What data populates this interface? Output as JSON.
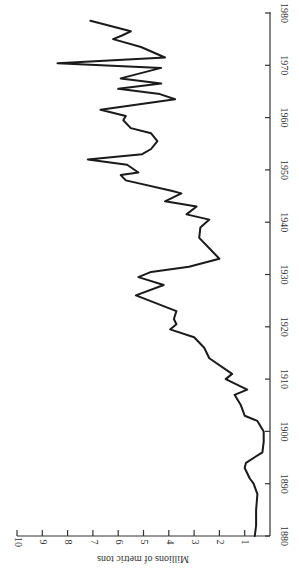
{
  "chart_data": {
    "type": "line",
    "title": "",
    "orientation": "rotated-90 (years run bottom-to-top along right edge; values increase leftward)",
    "xlabel": "",
    "ylabel": "Millions of metric tons",
    "xlim": [
      1880,
      1980
    ],
    "ylim": [
      0,
      10
    ],
    "x_ticks": [
      1880,
      1890,
      1900,
      1910,
      1920,
      1930,
      1940,
      1950,
      1960,
      1970,
      1980
    ],
    "y_ticks": [
      1,
      2,
      3,
      4,
      5,
      6,
      7,
      8,
      9,
      10
    ],
    "grid": false,
    "legend": null,
    "series": [
      {
        "name": "Production",
        "x": [
          1880,
          1882,
          1885,
          1888,
          1890,
          1891,
          1893,
          1894,
          1896,
          1898,
          1900,
          1902,
          1903,
          1905,
          1907,
          1908,
          1910,
          1911,
          1914,
          1916,
          1918,
          1919.5,
          1920.5,
          1921.5,
          1923,
          1926,
          1928,
          1929.5,
          1930.5,
          1931.5,
          1933,
          1935,
          1937,
          1939,
          1940.5,
          1941.5,
          1943,
          1944,
          1945.5,
          1946,
          1948,
          1949,
          1949.5,
          1951,
          1952,
          1953,
          1954,
          1955.5,
          1957,
          1958,
          1959.5,
          1960.3,
          1961.5,
          1963.5,
          1964.5,
          1965.5,
          1966.5,
          1967.5,
          1969.5,
          1970.4,
          1971.5,
          1973.5,
          1975,
          1975.7,
          1976.5,
          1978.5
        ],
        "values": [
          0.6,
          0.55,
          0.55,
          0.5,
          0.65,
          0.8,
          1.0,
          0.95,
          0.3,
          0.25,
          0.25,
          0.5,
          1.0,
          1.15,
          1.4,
          0.9,
          1.75,
          1.5,
          2.4,
          2.6,
          3.0,
          3.95,
          3.7,
          3.8,
          3.7,
          5.3,
          4.2,
          5.2,
          4.7,
          3.2,
          2.0,
          2.4,
          2.8,
          2.75,
          2.4,
          3.3,
          2.9,
          4.15,
          3.5,
          3.9,
          5.7,
          5.9,
          5.2,
          5.65,
          7.2,
          5.05,
          4.7,
          4.45,
          4.7,
          5.5,
          5.8,
          5.7,
          6.7,
          3.75,
          4.35,
          6.0,
          4.3,
          5.9,
          4.3,
          8.4,
          4.15,
          5.1,
          6.2,
          5.85,
          5.5,
          7.1
        ]
      }
    ]
  },
  "labels": {
    "y_axis_title": "Millions of metric tons",
    "x_ticks": [
      "1880",
      "1890",
      "1900",
      "1910",
      "1920",
      "1930",
      "1940",
      "1950",
      "1960",
      "1970",
      "1980"
    ],
    "y_ticks": [
      "1",
      "2",
      "3",
      "4",
      "5",
      "6",
      "7",
      "8",
      "9",
      "10"
    ]
  },
  "colors": {
    "line": "#1a1a1a",
    "axis": "#333333",
    "background": "#ffffff"
  }
}
